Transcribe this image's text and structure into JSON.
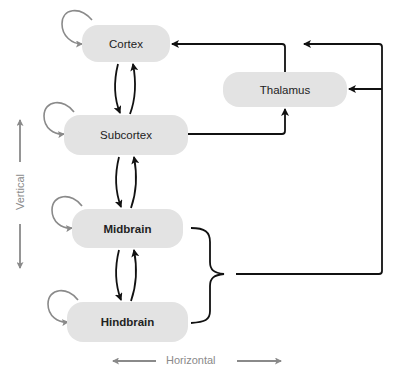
{
  "diagram": {
    "nodes": [
      {
        "id": "cortex",
        "label": "Cortex"
      },
      {
        "id": "subcortex",
        "label": "Subcortex"
      },
      {
        "id": "thalamus",
        "label": "Thalamus"
      },
      {
        "id": "midbrain",
        "label": "Midbrain"
      },
      {
        "id": "hindbrain",
        "label": "Hindbrain"
      }
    ],
    "edges": [
      {
        "from": "cortex",
        "to": "cortex",
        "type": "self-loop"
      },
      {
        "from": "subcortex",
        "to": "subcortex",
        "type": "self-loop"
      },
      {
        "from": "midbrain",
        "to": "midbrain",
        "type": "self-loop"
      },
      {
        "from": "hindbrain",
        "to": "hindbrain",
        "type": "self-loop"
      },
      {
        "from": "cortex",
        "to": "subcortex"
      },
      {
        "from": "subcortex",
        "to": "cortex"
      },
      {
        "from": "subcortex",
        "to": "midbrain"
      },
      {
        "from": "midbrain",
        "to": "subcortex"
      },
      {
        "from": "midbrain",
        "to": "hindbrain"
      },
      {
        "from": "hindbrain",
        "to": "midbrain"
      },
      {
        "from": "cortex",
        "to": "thalamus"
      },
      {
        "from": "subcortex",
        "to": "thalamus"
      },
      {
        "from": "midbrain+hindbrain",
        "to": "thalamus"
      },
      {
        "from": "midbrain+hindbrain",
        "to": "cortex"
      }
    ],
    "axes": {
      "vertical_label": "Vertical",
      "horizontal_label": "Horizontal"
    },
    "colors": {
      "node_fill": "#e3e3e3",
      "main_arrow": "#111111",
      "loop_arrow": "#8a8a8a",
      "axis": "#8a8a8a"
    }
  }
}
